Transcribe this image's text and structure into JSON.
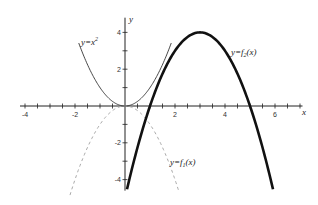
{
  "chart_data": {
    "type": "line",
    "title": "",
    "xlabel": "x",
    "ylabel": "y",
    "xlim": [
      -4.2,
      7.2
    ],
    "ylim": [
      -4.6,
      4.8
    ],
    "grid": false,
    "x_ticks": [
      -4,
      -2,
      2,
      4,
      6
    ],
    "x_tick_labels": [
      "-4",
      "-2",
      "2",
      "4",
      "6"
    ],
    "y_ticks": [
      4,
      2,
      -2,
      -4
    ],
    "y_tick_labels": [
      "4",
      "2",
      "-2",
      "-4"
    ],
    "x_minor_step": 0.5,
    "y_minor_step": 1,
    "series": [
      {
        "name": "y=x²",
        "label_base": "y=x",
        "label_sup": "2",
        "formula": "x^2",
        "style": "thin-solid",
        "x_range": [
          -1.85,
          1.85
        ],
        "x": [
          -1.8,
          -1.5,
          -1,
          -0.5,
          0,
          0.5,
          1,
          1.5,
          1.8
        ],
        "y": [
          3.24,
          2.25,
          1,
          0.25,
          0,
          0.25,
          1,
          2.25,
          3.24
        ]
      },
      {
        "name": "y=f1(x)",
        "label_base": "y=f",
        "label_sub": "1",
        "label_tail": "(x)",
        "formula": "-x^2",
        "style": "dashed-gray",
        "x_range": [
          -2.2,
          2.15
        ],
        "x": [
          -2,
          -1,
          0,
          1,
          2
        ],
        "y": [
          -4,
          -1,
          0,
          -1,
          -4
        ]
      },
      {
        "name": "y=f2(x)",
        "label_base": "y=f",
        "label_sub": "2",
        "label_tail": "(x)",
        "formula": "-(x-3)^2+4",
        "style": "thick-solid",
        "x_range": [
          0.08,
          5.92
        ],
        "x": [
          0.1,
          1,
          2,
          3,
          4,
          5,
          5.9
        ],
        "y": [
          -4.41,
          0,
          3,
          4,
          3,
          0,
          -4.41
        ]
      }
    ]
  },
  "labels": {
    "x_axis": "x",
    "y_axis": "y",
    "parabola": "y=x",
    "parabola_sup": "2",
    "f1_base": "y=f",
    "f1_sub": "1",
    "f1_tail": "(x)",
    "f2_base": "y=f",
    "f2_sub": "2",
    "f2_tail": "(x)"
  }
}
